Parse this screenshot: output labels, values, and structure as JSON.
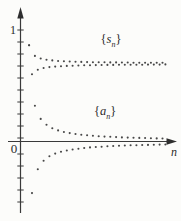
{
  "labels": {
    "one": "1",
    "zero": "0",
    "n": "n",
    "s_series": {
      "open": "{",
      "sym": "s",
      "sub": "n",
      "close": "}"
    },
    "a_series": {
      "open": "{",
      "sym": "a",
      "sub": "n",
      "close": "}"
    }
  },
  "colors": {
    "axis": "#3a3a3a",
    "dot": "#474747",
    "text": "#2b2b2b",
    "background": "#fcfcfa"
  },
  "chart_data": {
    "type": "scatter",
    "title": "",
    "xlabel": "n",
    "ylabel": "",
    "x_range": [
      1,
      48
    ],
    "ylim": [
      -0.55,
      1.15
    ],
    "grid": false,
    "y_tick_labels_shown": [
      "1",
      "0"
    ],
    "annotations": [
      "{s_n}",
      "{a_n}"
    ],
    "series": [
      {
        "name": "{s_n}",
        "description": "partial sums, converge to ~0.7",
        "values": [
          0.86,
          0.6,
          0.764,
          0.641,
          0.741,
          0.656,
          0.73,
          0.664,
          0.724,
          0.669,
          0.719,
          0.672,
          0.716,
          0.675,
          0.714,
          0.677,
          0.712,
          0.679,
          0.711,
          0.68,
          0.709,
          0.681,
          0.708,
          0.682,
          0.708,
          0.683,
          0.707,
          0.684,
          0.706,
          0.684,
          0.706,
          0.685,
          0.705,
          0.685,
          0.705,
          0.686,
          0.704,
          0.686,
          0.704,
          0.686,
          0.703,
          0.687,
          0.703,
          0.687,
          0.703,
          0.687,
          0.703,
          0.688
        ]
      },
      {
        "name": "{a_n}",
        "description": "alternating terms, converge to 0",
        "values": [
          0.86,
          -0.461,
          0.32,
          -0.247,
          0.202,
          -0.171,
          0.149,
          -0.132,
          0.119,
          -0.108,
          0.099,
          -0.092,
          0.085,
          -0.08,
          0.075,
          -0.071,
          0.067,
          -0.064,
          0.061,
          -0.058,
          0.055,
          -0.053,
          0.051,
          -0.049,
          0.047,
          -0.046,
          0.044,
          -0.043,
          0.042,
          -0.04,
          0.039,
          -0.038,
          0.037,
          -0.036,
          0.035,
          -0.034,
          0.033,
          -0.033,
          0.032,
          -0.031,
          0.031,
          -0.03,
          0.029,
          -0.029,
          0.028,
          -0.028,
          0.027,
          -0.027
        ]
      }
    ]
  }
}
